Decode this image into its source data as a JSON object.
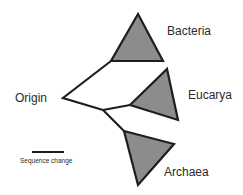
{
  "diagram": {
    "type": "phylogenetic-tree",
    "root_label": "Origin",
    "clades": [
      {
        "label": "Bacteria"
      },
      {
        "label": "Eucarya"
      },
      {
        "label": "Archaea"
      }
    ],
    "scale_bar": {
      "label": "Sequence change"
    },
    "colors": {
      "line": "#1e1e1e",
      "triangle_fill": "#8c8c8c",
      "text": "#2a2a2a"
    }
  }
}
